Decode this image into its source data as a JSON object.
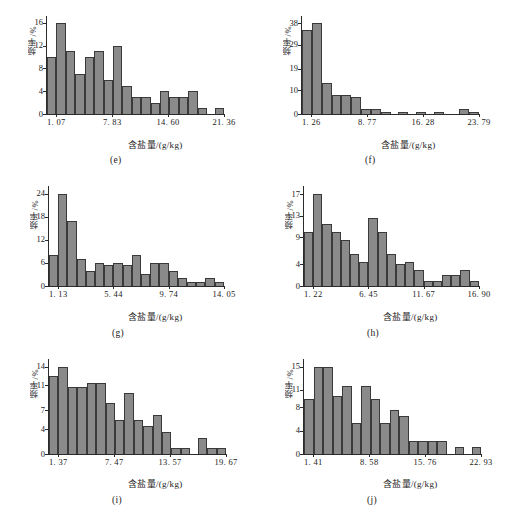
{
  "figure": {
    "panel_count": 6,
    "shared": {
      "ylabel": "频率/%",
      "xlabel": "含盐量/(g/kg)",
      "bar_fill": "#8a8a8a",
      "bar_stroke": "#3a3a3a",
      "axis_color": "#2b2b2b",
      "background": "#ffffff"
    }
  },
  "chart_data": [
    {
      "type": "bar",
      "panel": "e",
      "caption": "(e)",
      "title": "",
      "xlabel": "含盐量/(g/kg)",
      "ylabel": "频率/%",
      "yticks": [
        0,
        4,
        8,
        12,
        16
      ],
      "ylim": [
        0,
        17.2
      ],
      "grid": false,
      "legend": null,
      "xtick_labels": [
        "1. 07",
        "7. 83",
        "14. 60",
        "21. 36"
      ],
      "xtick_bin_index": [
        1,
        7,
        13,
        19
      ],
      "bin_count": 19,
      "values": [
        10,
        16,
        11,
        7,
        10,
        11,
        6,
        12,
        5,
        3,
        3,
        2,
        4,
        3,
        3,
        4,
        1,
        0,
        1
      ]
    },
    {
      "type": "bar",
      "panel": "f",
      "caption": "(f)",
      "title": "",
      "xlabel": "含盐量/(g/kg)",
      "ylabel": "频率/%",
      "yticks": [
        0,
        10,
        19,
        29,
        38
      ],
      "ylim": [
        0,
        41
      ],
      "grid": false,
      "legend": null,
      "xtick_labels": [
        "1. 26",
        "8. 77",
        "16. 28",
        "23. 79"
      ],
      "xtick_bin_index": [
        1,
        7,
        13,
        19
      ],
      "bin_count": 19,
      "values": [
        35,
        38,
        13,
        8,
        8,
        7,
        2,
        2,
        1,
        0,
        1,
        0,
        1,
        0,
        1,
        0,
        0,
        2,
        1
      ]
    },
    {
      "type": "bar",
      "panel": "g",
      "caption": "(g)",
      "title": "",
      "xlabel": "含盐量/(g/kg)",
      "ylabel": "频率/%",
      "yticks": [
        0,
        6,
        12,
        18,
        24
      ],
      "ylim": [
        0,
        26
      ],
      "grid": false,
      "legend": null,
      "xtick_labels": [
        "1. 13",
        "5. 44",
        "9. 74",
        "14. 05"
      ],
      "xtick_bin_index": [
        1,
        7,
        13,
        19
      ],
      "bin_count": 19,
      "values": [
        8,
        24,
        17,
        7,
        4,
        6,
        5.5,
        6,
        5.5,
        8,
        3,
        6,
        6,
        4,
        2,
        1,
        1,
        2,
        1
      ]
    },
    {
      "type": "bar",
      "panel": "h",
      "caption": "(h)",
      "title": "",
      "xlabel": "含盐量/(g/kg)",
      "ylabel": "频率/%",
      "yticks": [
        0,
        4,
        9,
        13,
        17
      ],
      "ylim": [
        0,
        18.5
      ],
      "grid": false,
      "legend": null,
      "xtick_labels": [
        "1. 22",
        "6. 45",
        "11. 67",
        "16. 90"
      ],
      "xtick_bin_index": [
        1,
        7,
        13,
        19
      ],
      "bin_count": 19,
      "values": [
        10,
        17,
        11.5,
        10,
        8.5,
        6,
        4.5,
        12.5,
        10,
        6,
        4,
        4.5,
        3,
        1,
        1,
        2,
        2,
        3,
        1
      ]
    },
    {
      "type": "bar",
      "panel": "i",
      "caption": "(i)",
      "title": "",
      "xlabel": "含盐量/(g/kg)",
      "ylabel": "频率/%",
      "yticks": [
        0,
        4,
        7,
        11,
        14
      ],
      "ylim": [
        0,
        15.2
      ],
      "grid": false,
      "legend": null,
      "xtick_labels": [
        "1. 37",
        "7. 47",
        "13. 57",
        "19. 67"
      ],
      "xtick_bin_index": [
        1,
        7,
        13,
        19
      ],
      "bin_count": 19,
      "values": [
        12.5,
        14,
        10.7,
        10.7,
        11.4,
        11.4,
        8.2,
        5.5,
        9.7,
        5.5,
        4.5,
        6.3,
        3.5,
        1,
        1,
        0,
        2.5,
        1,
        1
      ]
    },
    {
      "type": "bar",
      "panel": "j",
      "caption": "(j)",
      "title": "",
      "xlabel": "含盐量/(g/kg)",
      "ylabel": "频率/%",
      "yticks": [
        0,
        4,
        8,
        11,
        15
      ],
      "ylim": [
        0,
        16.3
      ],
      "grid": false,
      "legend": null,
      "xtick_labels": [
        "1. 41",
        "8. 58",
        "15. 76",
        "22. 93"
      ],
      "xtick_bin_index": [
        1,
        7,
        13,
        19
      ],
      "bin_count": 19,
      "values": [
        9.5,
        15,
        15,
        10,
        11.7,
        5.3,
        11.7,
        9.5,
        5.4,
        7.5,
        6.5,
        2.3,
        2.3,
        2.3,
        2.3,
        0,
        1.2,
        0,
        1.2
      ]
    }
  ]
}
